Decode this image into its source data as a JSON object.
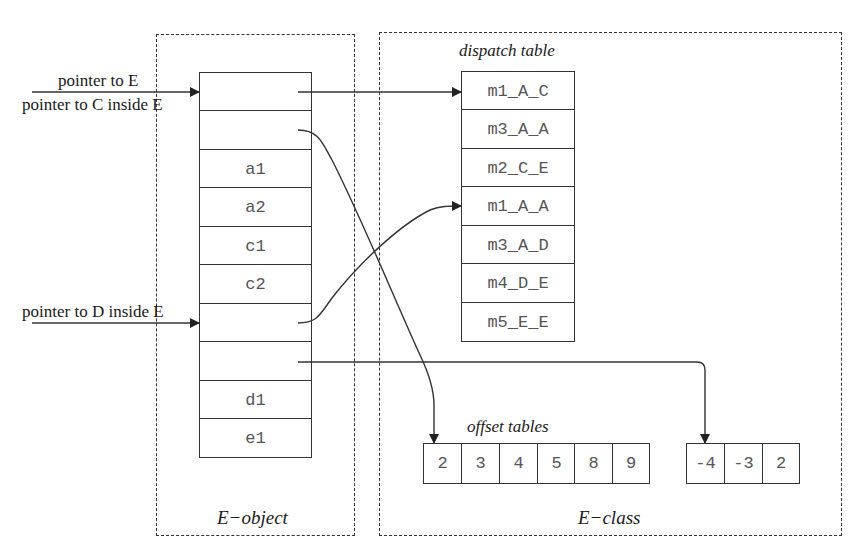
{
  "object_box": {
    "title": "E−object",
    "cells": [
      "",
      "",
      "a1",
      "a2",
      "c1",
      "c2",
      "",
      "",
      "d1",
      "e1"
    ]
  },
  "class_box": {
    "title": "E−class",
    "dispatch_table": {
      "title": "dispatch table",
      "entries": [
        "m1_A_C",
        "m3_A_A",
        "m2_C_E",
        "m1_A_A",
        "m3_A_D",
        "m4_D_E",
        "m5_E_E"
      ]
    },
    "offset_tables": {
      "title": "offset tables",
      "tables": [
        [
          "2",
          "3",
          "4",
          "5",
          "8",
          "9"
        ],
        [
          "-4",
          "-3",
          "2"
        ]
      ]
    }
  },
  "pointers": {
    "pointer_e": "pointer to E",
    "pointer_c": "pointer to C inside E",
    "pointer_d": "pointer to D inside E"
  },
  "colors": {
    "line": "#333333",
    "cell_text": "#555555",
    "label_text": "#1a1a1a",
    "background": "#ffffff"
  }
}
